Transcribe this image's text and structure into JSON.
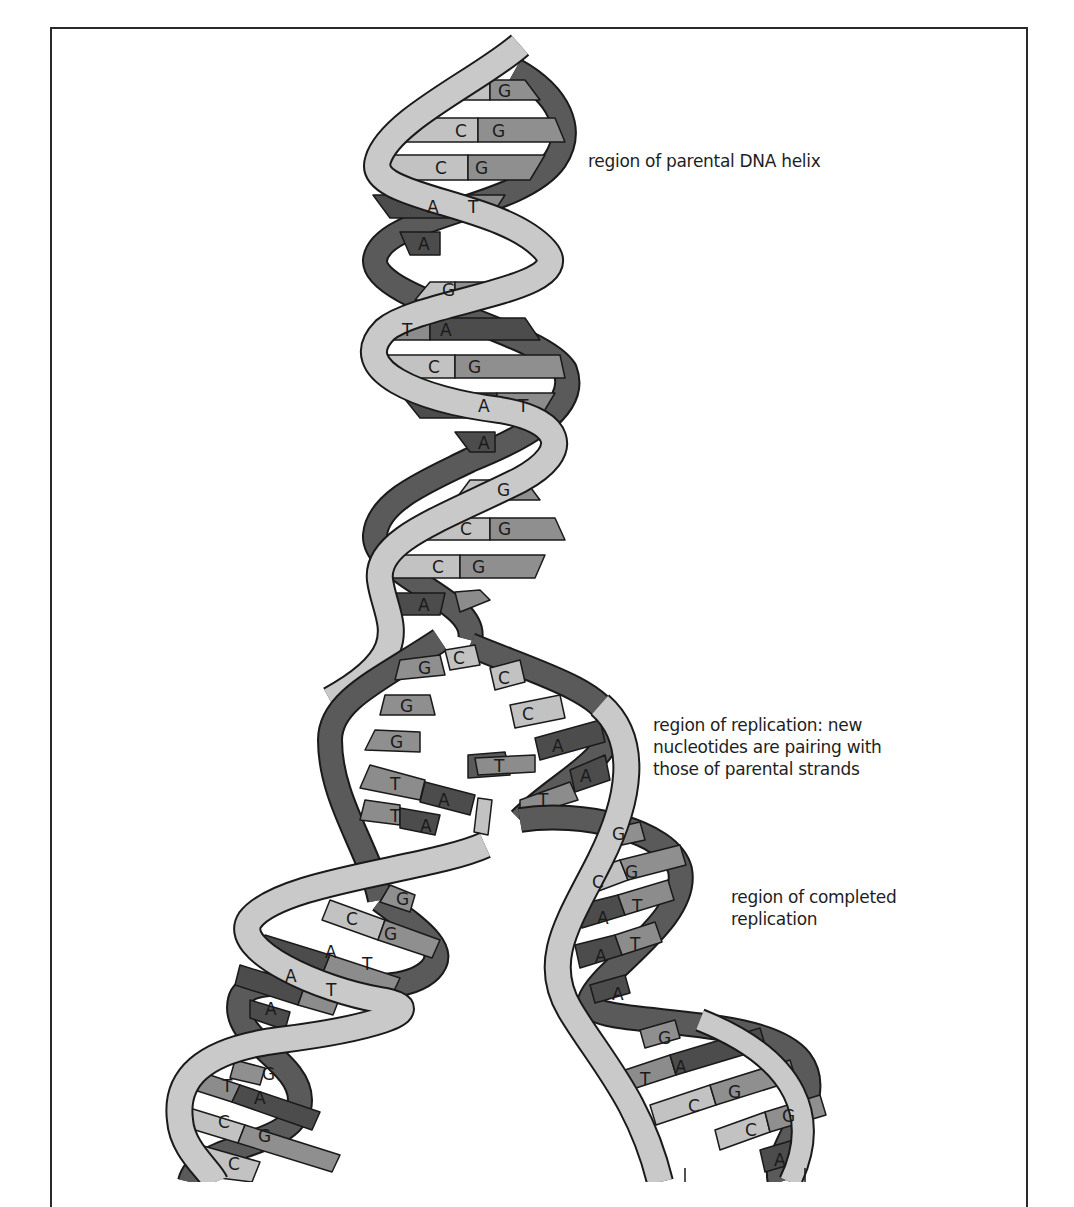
{
  "figure": {
    "labels": {
      "parental": "region of parental DNA helix",
      "replication_line1": "region of replication: new",
      "replication_line2": "nucleotides are pairing with",
      "replication_line3": "those of parental strands",
      "completed_line1": "region of completed",
      "completed_line2": "replication"
    },
    "colors": {
      "backbone_light": "#c9c9c9",
      "backbone_dark": "#5a5a5a",
      "base_A": "#4c4c4c",
      "base_T": "#8c8c8c",
      "base_G": "#8f8f8f",
      "base_C": "#c2c2c2",
      "outline": "#1a1a1a",
      "frame": "#2a2a2a"
    },
    "parental_helix_pairs": [
      {
        "left": "C",
        "right": "G"
      },
      {
        "left": "C",
        "right": "G"
      },
      {
        "left": "C",
        "right": "G"
      },
      {
        "left": "A",
        "right": "T"
      },
      {
        "left": "A",
        "right": "T"
      },
      {
        "left": "C",
        "right": "G"
      },
      {
        "left": "T",
        "right": "A"
      },
      {
        "left": "C",
        "right": "G"
      },
      {
        "left": "A",
        "right": "T"
      },
      {
        "left": "A",
        "right": "T"
      },
      {
        "left": "C",
        "right": "G"
      },
      {
        "left": "C",
        "right": "G"
      },
      {
        "left": "C",
        "right": "G"
      },
      {
        "left": "A",
        "right": "T"
      }
    ],
    "replication_fork": {
      "left_strand_bases": [
        "G",
        "G",
        "G",
        "T",
        "T"
      ],
      "right_strand_bases": [
        "C",
        "C",
        "C",
        "A",
        "A"
      ],
      "free_nucleotides": [
        "C",
        "T",
        "A"
      ],
      "new_pairs": [
        {
          "left": "T",
          "right": "A"
        },
        {
          "left": "T",
          "right": "A"
        },
        {
          "left": "T",
          "right": "A"
        }
      ]
    },
    "left_daughter_helix_pairs": [
      {
        "left": "C",
        "right": "G"
      },
      {
        "left": "C",
        "right": "G"
      },
      {
        "left": "A",
        "right": "T"
      },
      {
        "left": "A",
        "right": "T"
      },
      {
        "left": "A",
        "right": "T"
      },
      {
        "left": "C",
        "right": "G"
      },
      {
        "left": "T",
        "right": "A"
      },
      {
        "left": "C",
        "right": "G"
      },
      {
        "left": "C",
        "right": "G"
      }
    ],
    "right_daughter_helix_pairs": [
      {
        "left": "C",
        "right": "G"
      },
      {
        "left": "C",
        "right": "G"
      },
      {
        "left": "A",
        "right": "T"
      },
      {
        "left": "A",
        "right": "T"
      },
      {
        "left": "A",
        "right": "T"
      },
      {
        "left": "C",
        "right": "G"
      },
      {
        "left": "T",
        "right": "A"
      },
      {
        "left": "C",
        "right": "G"
      },
      {
        "left": "C",
        "right": "G"
      },
      {
        "left": "A",
        "right": "T"
      }
    ]
  }
}
